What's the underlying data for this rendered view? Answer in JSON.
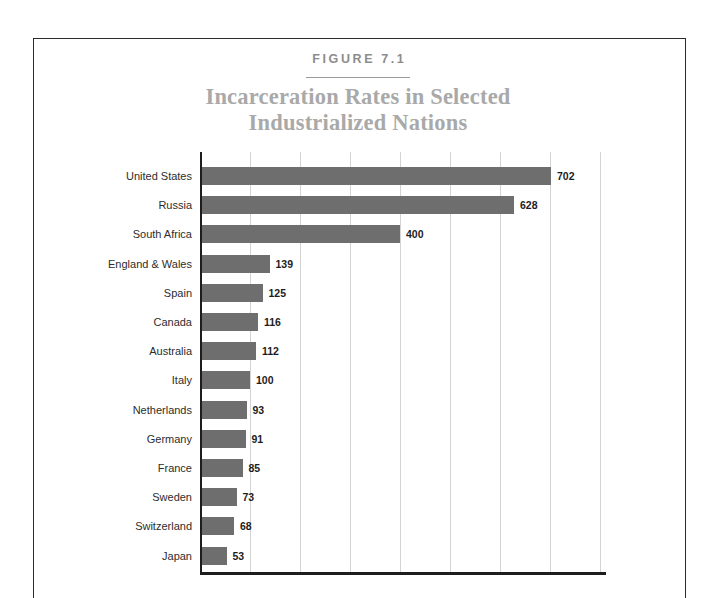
{
  "figure": {
    "label": "FIGURE 7.1",
    "title_line1": "Incarceration Rates in Selected",
    "title_line2": "Industrialized Nations"
  },
  "colors": {
    "bar": "#6e6e6e",
    "title": "#a9a9a9",
    "figure_label": "#8c8c8c",
    "gridline": "#d3d3d3",
    "axis": "#1d1d1d",
    "value_label": "#1d1d1d",
    "category_label": "#2d2d2d",
    "page_border": "#2b2b2b",
    "background": "#ffffff"
  },
  "chart_data": {
    "type": "bar",
    "orientation": "horizontal",
    "title": "Incarceration Rates in Selected Industrialized Nations",
    "xlabel": "",
    "ylabel": "",
    "xlim": [
      0,
      800
    ],
    "xticks": [
      100,
      200,
      300,
      400,
      500,
      600,
      700,
      800
    ],
    "grid": true,
    "legend": false,
    "value_labels": true,
    "categories": [
      "United States",
      "Russia",
      "South Africa",
      "England & Wales",
      "Spain",
      "Canada",
      "Australia",
      "Italy",
      "Netherlands",
      "Germany",
      "France",
      "Sweden",
      "Switzerland",
      "Japan"
    ],
    "values": [
      702,
      628,
      400,
      139,
      125,
      116,
      112,
      100,
      93,
      91,
      85,
      73,
      68,
      53
    ]
  }
}
